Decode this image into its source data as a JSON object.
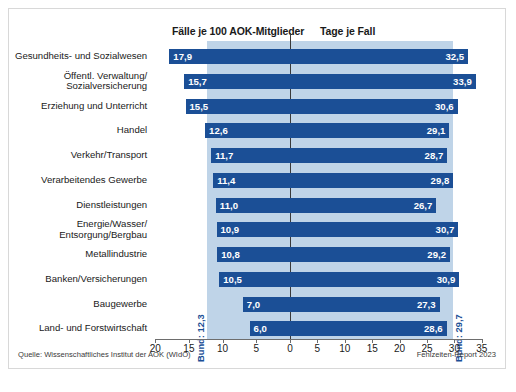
{
  "header": {
    "left_label": "Fälle je 100 AOK-Mitglieder",
    "right_label": "Tage je Fall"
  },
  "footer": {
    "source": "Quelle: Wissenschaftliches Institut der AOK (WIdO)",
    "report": "Fehlzeiten-Report 2023"
  },
  "annotations": {
    "bund_left": "Bund: 12,3",
    "bund_right": "Bund: 29,7"
  },
  "colors": {
    "bar": "#1b4f96",
    "band": "#bfd4e8",
    "axis": "#6d6d6d",
    "text": "#1a1a1a"
  },
  "chart_data": {
    "type": "bar",
    "title": "",
    "subtitle": "",
    "orientation": "horizontal",
    "layout": "bidirectional butterfly / tornado chart",
    "xlabel": "",
    "ylabel": "",
    "grid": false,
    "legend_position": "top",
    "categories": [
      "Gesundheits- und Sozialwesen",
      "Öffentl. Verwaltung/\nSozialversicherung",
      "Erziehung und Unterricht",
      "Handel",
      "Verkehr/Transport",
      "Verarbeitendes Gewerbe",
      "Dienstleistungen",
      "Energie/Wasser/\nEntsorgung/Bergbau",
      "Metallindustrie",
      "Banken/Versicherungen",
      "Baugewerbe",
      "Land- und Forstwirtschaft"
    ],
    "series": [
      {
        "name": "Fälle je 100 AOK-Mitglieder",
        "side": "left",
        "axis_min": 0,
        "axis_max": 20,
        "reference_value": 12.3,
        "reference_label": "Bund: 12,3",
        "values": [
          17.9,
          15.7,
          15.5,
          12.6,
          11.7,
          11.4,
          11.0,
          10.9,
          10.8,
          10.5,
          7.0,
          6.0
        ],
        "labels": [
          "17,9",
          "15,7",
          "15,5",
          "12,6",
          "11,7",
          "11,4",
          "11,0",
          "10,9",
          "10,8",
          "10,5",
          "7,0",
          "6,0"
        ]
      },
      {
        "name": "Tage je Fall",
        "side": "right",
        "axis_min": 0,
        "axis_max": 35,
        "reference_value": 29.7,
        "reference_label": "Bund: 29,7",
        "values": [
          32.5,
          33.9,
          30.6,
          29.1,
          28.7,
          29.8,
          26.7,
          30.7,
          29.2,
          30.9,
          27.3,
          28.6
        ],
        "labels": [
          "32,5",
          "33,9",
          "30,6",
          "29,1",
          "28,7",
          "29,8",
          "26,7",
          "30,7",
          "29,2",
          "30,9",
          "27,3",
          "28,6"
        ]
      }
    ],
    "axis_ticks_left": [
      20,
      15,
      10,
      5,
      0
    ],
    "axis_ticks_right": [
      5,
      10,
      15,
      20,
      25,
      30,
      35
    ],
    "axis_tick_labels": [
      "20",
      "15",
      "10",
      "5",
      "0",
      "5",
      "10",
      "15",
      "20",
      "25",
      "30",
      "35"
    ]
  }
}
